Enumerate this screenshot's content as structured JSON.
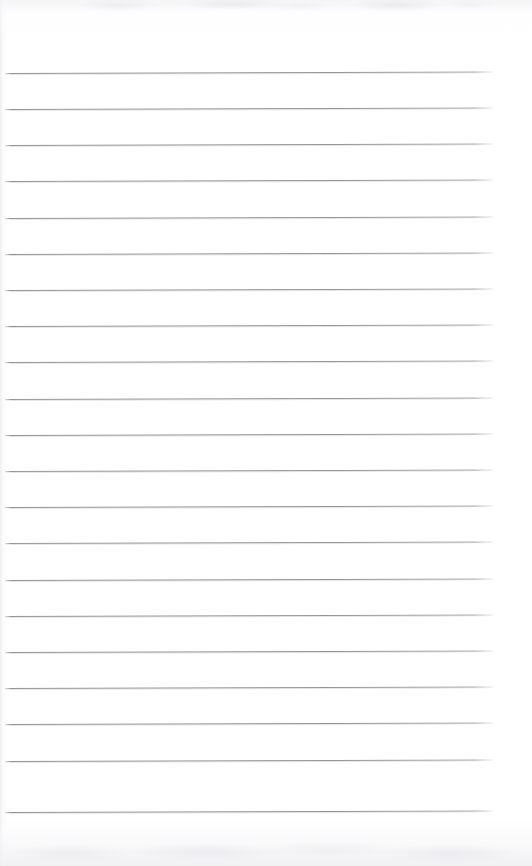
{
  "document": {
    "kind": "scanned-ruled-notebook-page",
    "title": "Blank ruled notebook page",
    "content_text": "",
    "page_width": 532,
    "page_height": 866,
    "background_color": "#ffffff",
    "rule_color": "#82828a",
    "rule_count": 21,
    "first_rule_y": 73,
    "rule_spacing": 36.2,
    "rule_left_x": 5,
    "rule_right_x": 493,
    "rule_skew_degrees": -0.18,
    "has_margin_rule": false,
    "has_handwriting": false,
    "edge_shadow_color": "#eeeef1"
  },
  "rules": [
    {
      "index": 1,
      "y": 73
    },
    {
      "index": 2,
      "y": 109
    },
    {
      "index": 3,
      "y": 145
    },
    {
      "index": 4,
      "y": 181
    },
    {
      "index": 5,
      "y": 218
    },
    {
      "index": 6,
      "y": 254
    },
    {
      "index": 7,
      "y": 290
    },
    {
      "index": 8,
      "y": 326
    },
    {
      "index": 9,
      "y": 362
    },
    {
      "index": 10,
      "y": 399
    },
    {
      "index": 11,
      "y": 435
    },
    {
      "index": 12,
      "y": 471
    },
    {
      "index": 13,
      "y": 507
    },
    {
      "index": 14,
      "y": 543
    },
    {
      "index": 15,
      "y": 580
    },
    {
      "index": 16,
      "y": 616
    },
    {
      "index": 17,
      "y": 652
    },
    {
      "index": 18,
      "y": 688
    },
    {
      "index": 19,
      "y": 724
    },
    {
      "index": 20,
      "y": 761
    },
    {
      "index": 21,
      "y": 812
    }
  ]
}
